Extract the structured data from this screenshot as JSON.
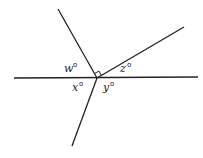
{
  "diagram": {
    "type": "geometry-angles",
    "intersection": {
      "x": 97,
      "y": 78
    },
    "lines": [
      {
        "name": "horizontal-line",
        "x1": 14,
        "y1": 78,
        "x2": 198,
        "y2": 77
      },
      {
        "name": "ray-upper-left",
        "x1": 97,
        "y1": 78,
        "x2": 58,
        "y2": 9
      },
      {
        "name": "ray-upper-right",
        "x1": 97,
        "y1": 78,
        "x2": 184,
        "y2": 27
      },
      {
        "name": "ray-lower-left",
        "x1": 97,
        "y1": 78,
        "x2": 72,
        "y2": 146
      }
    ],
    "right_angle_marker": true,
    "labels": {
      "w": "w",
      "z": "z",
      "x": "x",
      "y": "y",
      "degree": "o"
    }
  }
}
